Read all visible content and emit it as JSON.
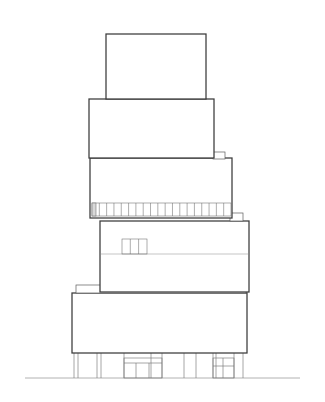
{
  "document": {
    "type": "architectural-elevation-drawing",
    "title": "Stepped Tower Building Elevation",
    "style": "line drawing, black stroke on white ground",
    "canvas": {
      "width": 325,
      "height": 402,
      "background": "#ffffff"
    },
    "colors": {
      "paper": "#ffffff",
      "heavy_outline": "#3a3a3a",
      "light_outline": "#5c5c5c",
      "hairline": "#8a8a8a",
      "mullion": "#6b6b6b",
      "ground_line": "#9a9a9a"
    }
  },
  "geometry": {
    "ground_line": {
      "x1": 25,
      "x2": 300,
      "y": 378
    },
    "tiers": [
      {
        "name": "tier-5-penthouse",
        "label": "Top volume (penthouse)",
        "x": 106,
        "y": 34,
        "width": 100,
        "height": 65
      },
      {
        "name": "tier-4-upper",
        "label": "Fourth volume",
        "x": 89,
        "y": 99,
        "width": 125,
        "height": 59
      },
      {
        "name": "tier-3-middle",
        "label": "Third volume with ribbon window band",
        "x": 90,
        "y": 158,
        "width": 142,
        "height": 60
      },
      {
        "name": "tier-2-lower",
        "label": "Second volume with small window group",
        "x": 100,
        "y": 221,
        "width": 149,
        "height": 71
      },
      {
        "name": "tier-1-base",
        "label": "Base volume on columns",
        "x": 72,
        "y": 293,
        "width": 175,
        "height": 60
      }
    ],
    "notches": [
      {
        "name": "notch-upper-right",
        "x": 213,
        "y": 152,
        "width": 12,
        "height": 7
      },
      {
        "name": "notch-lower-right",
        "x": 230,
        "y": 213,
        "width": 13,
        "height": 8
      }
    ],
    "canopy": {
      "name": "canopy-slab",
      "x": 76,
      "y": 285,
      "width": 170,
      "height": 8
    },
    "ribbon_window": {
      "name": "ribbon-window-band",
      "x": 92,
      "y": 203,
      "width": 139,
      "height": 13,
      "pane_count": 19,
      "end_panel_width": 4
    },
    "small_window_group": {
      "name": "small-window-group",
      "x": 122,
      "y": 239,
      "width": 25,
      "height": 15,
      "pane_count": 3
    },
    "tier2_band_line": {
      "y": 254,
      "x1": 100,
      "x2": 249
    },
    "colonnade": {
      "name": "colonnade",
      "top": 353,
      "bottom": 378,
      "column_x": [
        74,
        78,
        97,
        101,
        124,
        151,
        162,
        184,
        196,
        213,
        216,
        234,
        243
      ],
      "infill_panels": [
        {
          "x": 124,
          "y": 358,
          "width": 38,
          "height": 20,
          "divisions": 3
        },
        {
          "x": 213,
          "y": 358,
          "width": 21,
          "height": 20,
          "divisions": 2
        }
      ]
    }
  },
  "annotations": {
    "caption": "",
    "scale_note": "",
    "north_arrow": ""
  }
}
